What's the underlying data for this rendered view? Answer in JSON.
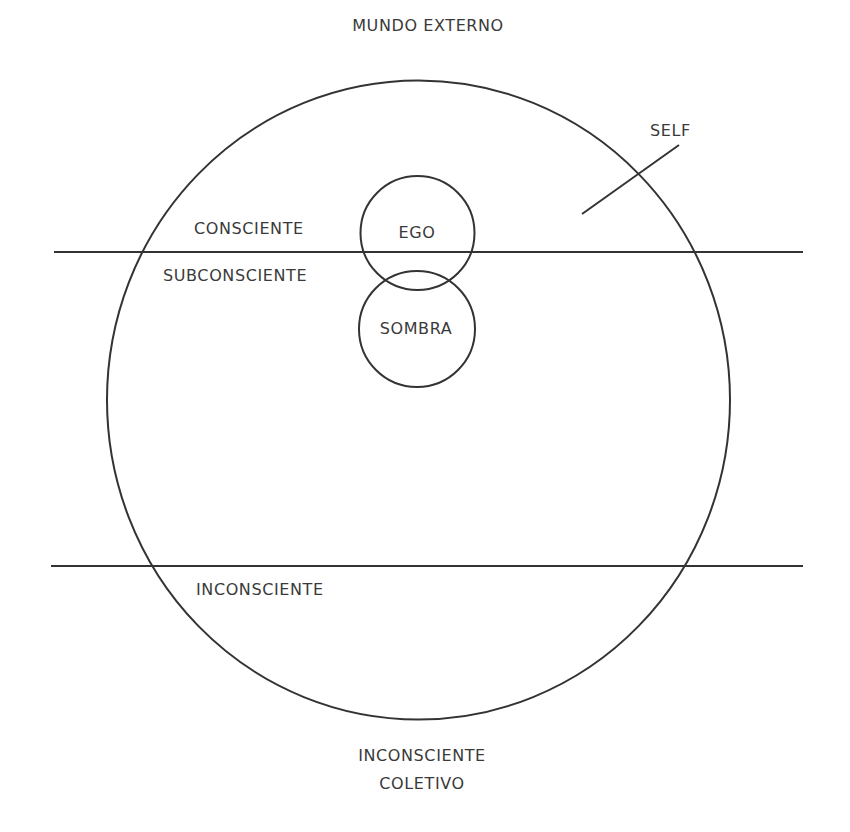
{
  "diagram": {
    "labels": {
      "outer_world": "MUNDO EXTERNO",
      "self": "SELF",
      "conscious": "CONSCIENTE",
      "subconscious": "SUBCONSCIENTE",
      "ego": "EGO",
      "shadow": "SOMBRA",
      "unconscious": "INCONSCIENTE",
      "collective_line1": "INCONSCIENTE",
      "collective_line2": "COLETIVO"
    },
    "colors": {
      "stroke": "#333333",
      "text": "#3a3a3a",
      "background": "#ffffff"
    }
  }
}
